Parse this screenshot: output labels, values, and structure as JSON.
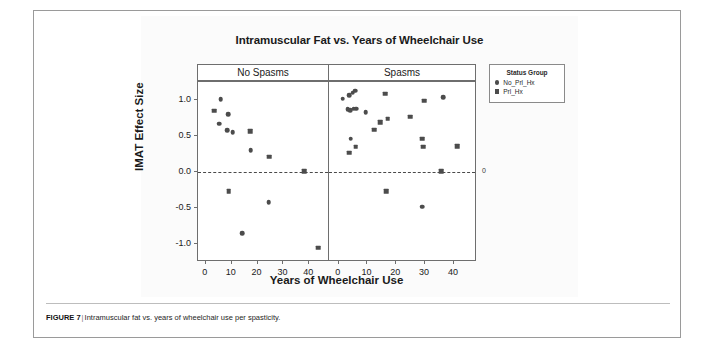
{
  "figure": {
    "caption_label": "FIGURE 7",
    "caption_separator": "|",
    "caption_text": "Intramuscular fat vs. years of wheelchair use per spasticity."
  },
  "legend": {
    "title": "Status Group",
    "entries": [
      {
        "label": "No_Prl_Hx",
        "marker": "circle",
        "color": "#4c4c4c"
      },
      {
        "label": "Prl_Hx",
        "marker": "square",
        "color": "#4c4c4c"
      }
    ]
  },
  "chart_data": {
    "type": "scatter",
    "title": "Intramuscular Fat vs. Years of Wheelchair Use",
    "xlabel": "Years of Wheelchair Use",
    "ylabel": "IMAT Effect Size",
    "xlim": [
      -3,
      48
    ],
    "ylim": [
      -1.25,
      1.25
    ],
    "xticks": [
      0,
      10,
      20,
      30,
      40
    ],
    "xtick_labels": [
      "0",
      "10",
      "20",
      "30",
      "40"
    ],
    "yticks": [
      1.0,
      0.5,
      0.0,
      -0.5,
      -1.0
    ],
    "ytick_labels": [
      "1.0",
      "0.5",
      "0.0",
      "-0.5",
      "-1.0"
    ],
    "grid": false,
    "legend_position": "right",
    "reference_line": {
      "y": 0,
      "style": "dashed",
      "label": "0"
    },
    "facets": [
      {
        "name": "No Spasms",
        "series": [
          {
            "name": "No_Prl_Hx",
            "marker": "circle",
            "points": [
              {
                "x": 5.8,
                "y": 1.01
              },
              {
                "x": 8.6,
                "y": 0.8
              },
              {
                "x": 5.2,
                "y": 0.67
              },
              {
                "x": 8.3,
                "y": 0.58
              },
              {
                "x": 10.4,
                "y": 0.55
              },
              {
                "x": 17.4,
                "y": 0.3
              },
              {
                "x": 24.3,
                "y": -0.42
              },
              {
                "x": 14.0,
                "y": -0.85
              }
            ]
          },
          {
            "name": "Prl_Hx",
            "marker": "square",
            "points": [
              {
                "x": 3.2,
                "y": 0.85
              },
              {
                "x": 17.2,
                "y": 0.57
              },
              {
                "x": 24.5,
                "y": 0.21
              },
              {
                "x": 38.0,
                "y": 0.01
              },
              {
                "x": 8.8,
                "y": -0.27
              },
              {
                "x": 43.5,
                "y": -1.05
              }
            ]
          }
        ]
      },
      {
        "name": "Spasms",
        "series": [
          {
            "name": "No_Prl_Hx",
            "marker": "circle",
            "points": [
              {
                "x": 1.8,
                "y": 1.02
              },
              {
                "x": 4.0,
                "y": 1.07
              },
              {
                "x": 5.2,
                "y": 1.1
              },
              {
                "x": 6.0,
                "y": 1.13
              },
              {
                "x": 3.5,
                "y": 0.87
              },
              {
                "x": 4.4,
                "y": 0.86
              },
              {
                "x": 5.6,
                "y": 0.88
              },
              {
                "x": 6.4,
                "y": 0.88
              },
              {
                "x": 9.8,
                "y": 0.83
              },
              {
                "x": 36.6,
                "y": 1.04
              },
              {
                "x": 4.6,
                "y": 0.46
              },
              {
                "x": 29.4,
                "y": -0.48
              }
            ]
          },
          {
            "name": "Prl_Hx",
            "marker": "square",
            "points": [
              {
                "x": 16.5,
                "y": 1.09
              },
              {
                "x": 30.0,
                "y": 0.99
              },
              {
                "x": 25.2,
                "y": 0.77
              },
              {
                "x": 17.4,
                "y": 0.74
              },
              {
                "x": 14.8,
                "y": 0.69
              },
              {
                "x": 12.6,
                "y": 0.59
              },
              {
                "x": 29.4,
                "y": 0.46
              },
              {
                "x": 29.6,
                "y": 0.35
              },
              {
                "x": 41.4,
                "y": 0.36
              },
              {
                "x": 6.2,
                "y": 0.35
              },
              {
                "x": 4.0,
                "y": 0.27
              },
              {
                "x": 36.0,
                "y": 0.01
              },
              {
                "x": 16.8,
                "y": -0.27
              }
            ]
          }
        ]
      }
    ]
  }
}
